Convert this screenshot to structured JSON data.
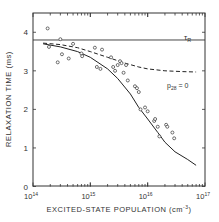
{
  "chart_data": {
    "type": "scatter",
    "title": "",
    "xlabel": "EXCITED-STATE POPULATION (cm⁻³)",
    "ylabel": "RELAXATION TIME (ms)",
    "xscale": "log",
    "xlim": [
      100000000000000.0,
      1e+17
    ],
    "ylim": [
      0,
      4.5
    ],
    "x_ticks": [
      {
        "v": 100000000000000.0,
        "label": "10",
        "exp": "14"
      },
      {
        "v": 1000000000000000.0,
        "label": "10",
        "exp": "15"
      },
      {
        "v": 1e+16,
        "label": "10",
        "exp": "16"
      },
      {
        "v": 1e+17,
        "label": "10",
        "exp": "17"
      }
    ],
    "y_ticks": [
      0,
      1,
      2,
      3,
      4
    ],
    "grid": false,
    "annotations": [
      {
        "text": "τR",
        "x": 4e+16,
        "y": 3.82
      },
      {
        "text": "p28 = 0",
        "x": 2.2e+16,
        "y": 2.52
      }
    ],
    "series": [
      {
        "name": "τR",
        "kind": "hline",
        "style": "solid",
        "y": 3.8
      },
      {
        "name": "p28 = 0",
        "kind": "line",
        "style": "dashed",
        "x": [
          150000000000000.0,
          300000000000000.0,
          600000000000000.0,
          1000000000000000.0,
          2000000000000000.0,
          4000000000000000.0,
          7000000000000000.0,
          1e+16,
          2e+16,
          4e+16,
          7e+16
        ],
        "y": [
          3.72,
          3.68,
          3.6,
          3.5,
          3.35,
          3.2,
          3.1,
          3.05,
          3.0,
          2.98,
          2.97
        ]
      },
      {
        "name": "model fit",
        "kind": "line",
        "style": "solid",
        "x": [
          150000000000000.0,
          300000000000000.0,
          600000000000000.0,
          1000000000000000.0,
          2000000000000000.0,
          3000000000000000.0,
          5000000000000000.0,
          7000000000000000.0,
          1e+16,
          1.5e+16,
          2e+16,
          3e+16,
          5e+16,
          7e+16
        ],
        "y": [
          3.7,
          3.62,
          3.5,
          3.35,
          3.05,
          2.8,
          2.4,
          2.05,
          1.75,
          1.4,
          1.15,
          0.9,
          0.7,
          0.55
        ]
      },
      {
        "name": "measured",
        "kind": "points",
        "x": [
          180000000000000.0,
          190000000000000.0,
          300000000000000.0,
          320000000000000.0,
          270000000000000.0,
          420000000000000.0,
          500000000000000.0,
          700000000000000.0,
          720000000000000.0,
          1200000000000000.0,
          1300000000000000.0,
          1500000000000000.0,
          1600000000000000.0,
          2300000000000000.0,
          2500000000000000.0,
          2700000000000000.0,
          3000000000000000.0,
          3300000000000000.0,
          3500000000000000.0,
          3800000000000000.0,
          4200000000000000.0,
          4500000000000000.0,
          6000000000000000.0,
          6500000000000000.0,
          7000000000000000.0,
          7500000000000000.0,
          9000000000000000.0,
          1e+16,
          1.3e+16,
          1.35e+16,
          1.5e+16,
          1.6e+16,
          2.1e+16,
          2.2e+16,
          2.7e+16,
          2.9e+16
        ],
        "y": [
          4.1,
          3.62,
          3.82,
          3.43,
          3.22,
          3.32,
          3.7,
          3.45,
          3.38,
          3.6,
          3.1,
          3.05,
          3.55,
          3.35,
          3.1,
          3.0,
          3.15,
          3.25,
          3.2,
          2.95,
          3.15,
          2.75,
          2.6,
          2.55,
          2.45,
          2.0,
          2.05,
          1.95,
          1.7,
          1.75,
          1.55,
          1.3,
          1.6,
          1.55,
          1.4,
          1.25
        ]
      }
    ]
  },
  "labels": {
    "ylabel": "RELAXATION TIME (ms)",
    "xlabel": "EXCITED-STATE POPULATION (cm",
    "xlabel_exp": "-3",
    "xlabel_close": ")",
    "tau_r": "τ",
    "tau_r_sub": "R",
    "p28": "p",
    "p28_sub": "28",
    "p28_eq": " = 0"
  }
}
